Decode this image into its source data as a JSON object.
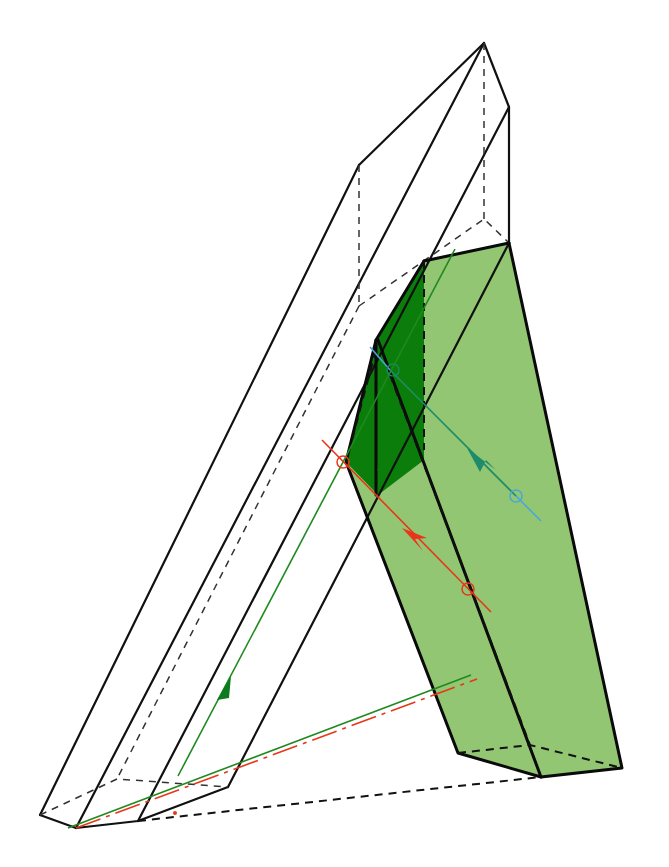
{
  "figure": {
    "caption_fragment": "",
    "colors": {
      "background": "#ffffff",
      "edge": "#111111",
      "dashed_edge": "#333333",
      "light_green_face": "#8cc36a",
      "dark_green_face": "#0a7a0a",
      "green_ray": "#1f8a1f",
      "red_ray": "#e8361b",
      "red_ray_dashed": "#e8361b",
      "blue_ray": "#4aa6d6",
      "teal_ray": "#1e8c6a"
    },
    "elements": {
      "outer_prism": "wireframe slanted prism (two outer hexagonal ends joined by long parallel edges)",
      "green_block": "light green translucent slab leaning against the prism",
      "dark_green_wedge": "dark green intersection region",
      "green_ray": "green ray with upward arrow",
      "red_ray": "red ray with arrow and two circle markers",
      "blue_ray": "blue/teal ray with arrow and circle marker"
    }
  }
}
